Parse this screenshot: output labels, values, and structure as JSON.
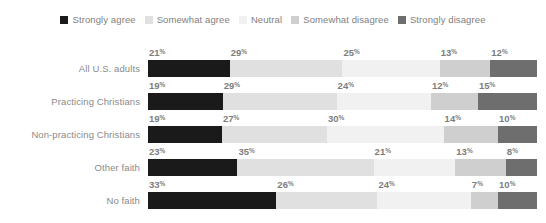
{
  "legend": {
    "items": [
      {
        "label": "Strongly agree",
        "color": "#1a1a1a",
        "icon": "square-swatch-icon"
      },
      {
        "label": "Somewhat agree",
        "color": "#e0e0e0",
        "icon": "square-swatch-icon"
      },
      {
        "label": "Neutral",
        "color": "#f1f1f1",
        "icon": "square-swatch-icon"
      },
      {
        "label": "Somewhat disagree",
        "color": "#cfcfcf",
        "icon": "square-swatch-icon"
      },
      {
        "label": "Strongly disagree",
        "color": "#6e6e6e",
        "icon": "square-swatch-icon"
      }
    ]
  },
  "chart_data": {
    "type": "bar",
    "orientation": "horizontal",
    "stacked": true,
    "normalized_percent": true,
    "title": "",
    "subtitle": "",
    "xlabel": "",
    "ylabel": "",
    "xlim": [
      0,
      100
    ],
    "grid": false,
    "legend_position": "top-center",
    "value_suffix": "%",
    "categories": [
      "All U.S. adults",
      "Practicing Christians",
      "Non-practicing Christians",
      "Other faith",
      "No faith"
    ],
    "series": [
      {
        "name": "Strongly agree",
        "color": "#1a1a1a",
        "values": [
          21,
          19,
          19,
          23,
          33
        ]
      },
      {
        "name": "Somewhat agree",
        "color": "#e0e0e0",
        "values": [
          29,
          29,
          27,
          35,
          26
        ]
      },
      {
        "name": "Neutral",
        "color": "#f1f1f1",
        "values": [
          25,
          24,
          30,
          21,
          24
        ]
      },
      {
        "name": "Somewhat disagree",
        "color": "#cfcfcf",
        "values": [
          13,
          12,
          14,
          13,
          7
        ]
      },
      {
        "name": "Strongly disagree",
        "color": "#6e6e6e",
        "values": [
          12,
          15,
          10,
          8,
          10
        ]
      }
    ],
    "rows": [
      {
        "label": "All U.S. adults",
        "values": [
          21,
          29,
          25,
          13,
          12
        ]
      },
      {
        "label": "Practicing Christians",
        "values": [
          19,
          29,
          24,
          12,
          15
        ]
      },
      {
        "label": "Non-practicing Christians",
        "values": [
          19,
          27,
          30,
          14,
          10
        ]
      },
      {
        "label": "Other faith",
        "values": [
          23,
          35,
          21,
          13,
          8
        ]
      },
      {
        "label": "No faith",
        "values": [
          33,
          26,
          24,
          7,
          10
        ]
      }
    ]
  }
}
